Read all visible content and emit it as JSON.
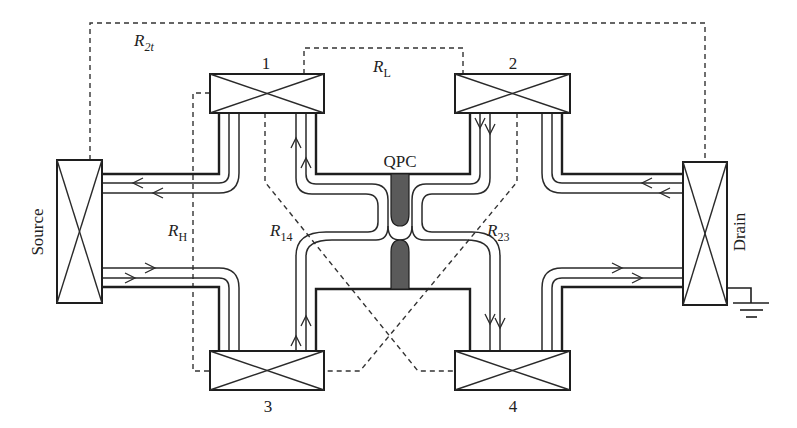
{
  "figure": {
    "colors": {
      "line": "#1e1e1e",
      "gate": "#5a5a5a",
      "background": "#ffffff"
    }
  },
  "contacts": {
    "source": {
      "label": "Source"
    },
    "drain": {
      "label": "Drain"
    },
    "c1": {
      "label": "1"
    },
    "c2": {
      "label": "2"
    },
    "c3": {
      "label": "3"
    },
    "c4": {
      "label": "4"
    }
  },
  "gate": {
    "label": "QPC"
  },
  "resistances": {
    "r2t": {
      "main": "R",
      "sub": "2t"
    },
    "rl": {
      "main": "R",
      "sub": "L"
    },
    "rh": {
      "main": "R",
      "sub": "H"
    },
    "r14": {
      "main": "R",
      "sub": "14"
    },
    "r23": {
      "main": "R",
      "sub": "23"
    }
  },
  "icons": {
    "ground": "ground-symbol",
    "contact": "crossed-box-ohmic-contact",
    "arrow": "chevron-arrow"
  }
}
